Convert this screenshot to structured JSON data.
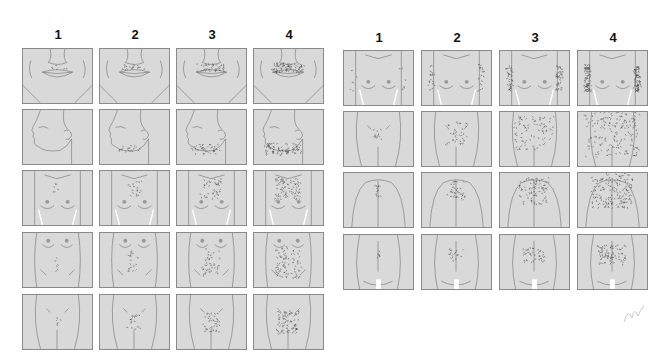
{
  "figure": {
    "left_grid": {
      "column_labels": [
        "1",
        "2",
        "3",
        "4"
      ],
      "rows": [
        {
          "region": "upper-lip",
          "grades": [
            "1",
            "2",
            "3",
            "4"
          ]
        },
        {
          "region": "chin",
          "grades": [
            "1",
            "2",
            "3",
            "4"
          ]
        },
        {
          "region": "chest",
          "grades": [
            "1",
            "2",
            "3",
            "4"
          ]
        },
        {
          "region": "upper-abdomen",
          "grades": [
            "1",
            "2",
            "3",
            "4"
          ]
        },
        {
          "region": "lower-abdomen",
          "grades": [
            "1",
            "2",
            "3",
            "4"
          ]
        }
      ]
    },
    "right_grid": {
      "column_labels": [
        "1",
        "2",
        "3",
        "4"
      ],
      "rows": [
        {
          "region": "upper-arms",
          "grades": [
            "1",
            "2",
            "3",
            "4"
          ]
        },
        {
          "region": "thighs",
          "grades": [
            "1",
            "2",
            "3",
            "4"
          ]
        },
        {
          "region": "upper-back",
          "grades": [
            "1",
            "2",
            "3",
            "4"
          ]
        },
        {
          "region": "lower-back",
          "grades": [
            "1",
            "2",
            "3",
            "4"
          ]
        }
      ]
    },
    "colors": {
      "skin": "#d9d9d9",
      "outline": "#6e6e6e",
      "hair": "#333333",
      "border": "#8a8a8a",
      "background": "#ffffff"
    }
  }
}
